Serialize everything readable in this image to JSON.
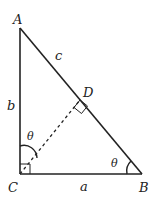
{
  "diagram": {
    "type": "right-triangle-altitude",
    "vertices": {
      "A": {
        "label": "A",
        "x": 20,
        "y": 28
      },
      "B": {
        "label": "B",
        "x": 142,
        "y": 174
      },
      "C": {
        "label": "C",
        "x": 20,
        "y": 174
      },
      "D": {
        "label": "D",
        "x": 80,
        "y": 100
      }
    },
    "sides": {
      "a": "a",
      "b": "b",
      "c": "c"
    },
    "angles": {
      "at_C_upper": "θ",
      "at_B": "θ"
    },
    "colors": {
      "stroke": "#222222",
      "background": "#ffffff"
    }
  }
}
